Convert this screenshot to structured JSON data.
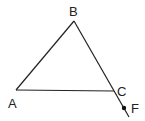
{
  "diagram": {
    "type": "geometry-triangle",
    "points": {
      "A": {
        "label": "A",
        "x": 16,
        "y": 90
      },
      "B": {
        "label": "B",
        "x": 74,
        "y": 21
      },
      "C": {
        "label": "C",
        "x": 114,
        "y": 91
      },
      "F": {
        "label": "F",
        "x": 124,
        "y": 108
      }
    },
    "segments": [
      [
        "A",
        "B"
      ],
      [
        "B",
        "C"
      ],
      [
        "A",
        "C"
      ]
    ],
    "extension": {
      "from": "B",
      "through": "C",
      "end": {
        "x": 129,
        "y": 117
      }
    },
    "colors": {
      "line": "#222222",
      "background": "#ffffff"
    }
  }
}
